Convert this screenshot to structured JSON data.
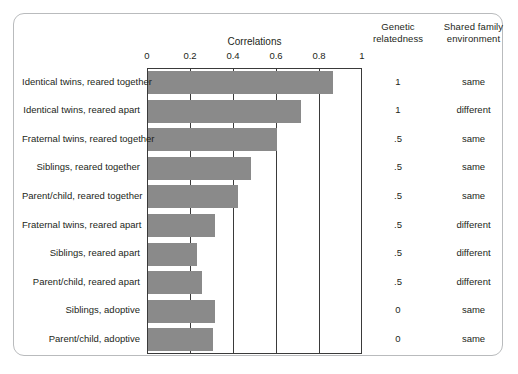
{
  "figure": {
    "title": "Correlations",
    "columns": {
      "genetic_relatedness": "Genetic relatedness",
      "genetic_relatedness_line1": "Genetic",
      "genetic_relatedness_line2": "relatedness",
      "shared_family_environment": "Shared family environment",
      "shared_family_line1": "Shared family",
      "shared_family_line2": "environment"
    },
    "bar_color": "#8a8a8a",
    "axis_color": "#3a3a3a",
    "card_border_color": "#b9bbbd"
  },
  "chart_data": {
    "type": "bar",
    "orientation": "horizontal",
    "title": "Correlations",
    "xlabel": "Correlations",
    "ylabel": "",
    "xlim": [
      0,
      1
    ],
    "xticks": [
      "0",
      "0.2",
      "0.4",
      "0.6",
      "0.8",
      "1"
    ],
    "xtick_values": [
      0,
      0.2,
      0.4,
      0.6,
      0.8,
      1
    ],
    "grid": true,
    "legend": "none",
    "categories": [
      "Identical twins, reared together",
      "Identical twins, reared apart",
      "Fraternal twins, reared together",
      "Siblings, reared together",
      "Parent/child, reared together",
      "Fraternal twins, reared apart",
      "Siblings, reared apart",
      "Parent/child, reared apart",
      "Siblings, adoptive",
      "Parent/child, adoptive"
    ],
    "values": [
      0.86,
      0.71,
      0.6,
      0.48,
      0.42,
      0.31,
      0.23,
      0.25,
      0.31,
      0.3
    ],
    "annotations": {
      "genetic_relatedness": [
        "1",
        "1",
        ".5",
        ".5",
        ".5",
        ".5",
        ".5",
        ".5",
        "0",
        "0"
      ],
      "shared_family_environment": [
        "same",
        "different",
        "same",
        "same",
        "same",
        "different",
        "different",
        "different",
        "same",
        "same"
      ]
    }
  }
}
